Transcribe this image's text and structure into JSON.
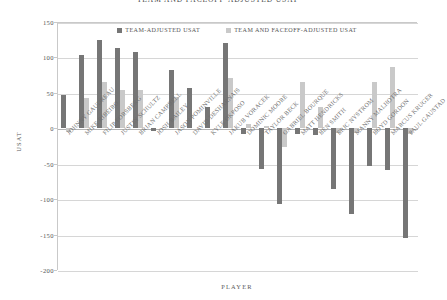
{
  "chart_data": {
    "type": "bar",
    "title": "TEAM AND FACEOFF-ADJUSTED USAT",
    "xlabel": "PLAYER",
    "ylabel": "USAT",
    "ylim": [
      -200,
      150
    ],
    "yticks": [
      150,
      100,
      50,
      0,
      -50,
      -100,
      -150,
      -200
    ],
    "grid": true,
    "legend_position": "top-center",
    "categories": [
      "JOHNNY GAUDREAU",
      "MIKE RIBEIRO",
      "FILIP FORSBERG",
      "JUSTIN SCHULTZ",
      "BRIAN CAMPBELL",
      "JOSH BAILEY",
      "JASON POMINVILLE",
      "DAVID DESHARNAIS",
      "KYLE OKPOSO",
      "JAKUB VORACEK",
      "DOMINIC MOORE",
      "TAYLOR BECK",
      "GABRIEL BOURQUE",
      "MATT HENDRICKS",
      "BEN SMITH",
      "ERIC NYSTROM",
      "MANNY MALHOTRA",
      "BOYD GORDON",
      "MARCUS KRUGER",
      "PAUL GAUSTAD"
    ],
    "series": [
      {
        "name": "TEAM-ADJUSTED USAT",
        "color": "#767676",
        "values": [
          47,
          104,
          125,
          113,
          108,
          -4,
          82,
          57,
          30,
          120,
          -8,
          -58,
          -107,
          -8,
          -10,
          -86,
          -121,
          -53,
          -59,
          -155
        ]
      },
      {
        "name": "TEAM AND FACEOFF-ADJUSTED USAT",
        "color": "#c9c9c9",
        "values": [
          -5,
          43,
          65,
          54,
          54,
          0,
          44,
          0,
          0,
          71,
          6,
          3,
          -26,
          66,
          30,
          -6,
          -6,
          66,
          87,
          -8
        ]
      }
    ]
  }
}
